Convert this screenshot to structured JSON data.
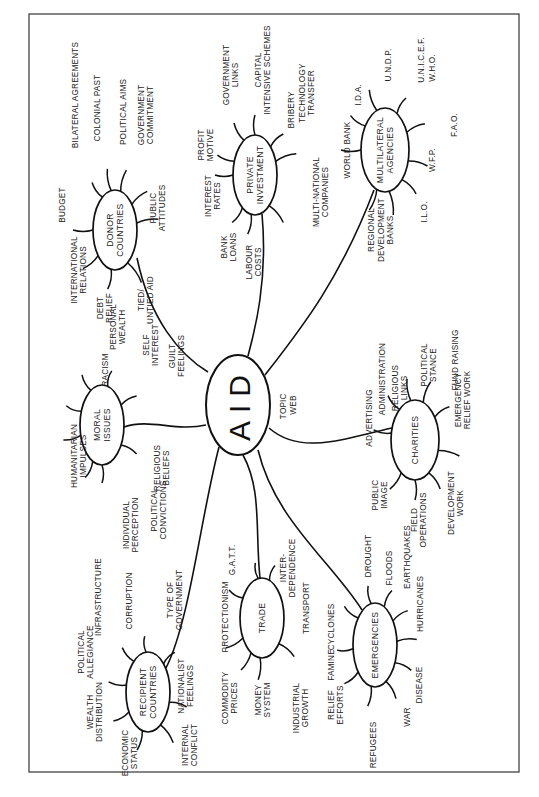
{
  "diagram": {
    "type": "topic-web",
    "orientation": "rotated-90-ccw",
    "hub": {
      "label": "AID",
      "note": [
        "TOPIC",
        "WEB"
      ]
    },
    "nodes": [
      {
        "id": "donor",
        "label": [
          "DONOR",
          "COUNTRIES"
        ],
        "branches": [
          [
            "BUDGET"
          ],
          [
            "BILATERAL AGREEMENTS"
          ],
          [
            "COLONIAL PAST"
          ],
          [
            "POLITICAL AIMS"
          ],
          [
            "GOVERNMENT",
            "COMMITMENT"
          ],
          [
            "PUBLIC",
            "ATTITUDES"
          ],
          [
            "TIED/",
            "UNTIED AID"
          ],
          [
            "DEBT",
            "RELIEF"
          ],
          [
            "INTERNATIONAL",
            "RELATIONS"
          ]
        ]
      },
      {
        "id": "private",
        "label": [
          "PRIVATE",
          "INVESTMENT"
        ],
        "branches": [
          [
            "PROFIT",
            "MOTIVE"
          ],
          [
            "GOVERNMENT",
            "LINKS"
          ],
          [
            "CAPITAL",
            "INTENSIVE SCHEMES"
          ],
          [
            "BRIBERY"
          ],
          [
            "TECHNOLOGY",
            "TRANSFER"
          ],
          [
            "MULTI-NATIONAL",
            "COMPANIES"
          ],
          [
            "LABOUR",
            "COSTS"
          ],
          [
            "BANK",
            "LOANS"
          ],
          [
            "INTEREST",
            "RATES"
          ]
        ]
      },
      {
        "id": "multilateral",
        "label": [
          "MULTILATERAL",
          "AGENCIES"
        ],
        "branches": [
          [
            "WORLD BANK"
          ],
          [
            "I.D.A."
          ],
          [
            "U.N.D.P."
          ],
          [
            "W.H.O."
          ],
          [
            "U.N.I.C.E.F."
          ],
          [
            "F.A.O."
          ],
          [
            "W.F.P."
          ],
          [
            "I.L.O."
          ],
          [
            "REGIONAL",
            "DEVELOPMENT",
            "BANKS"
          ]
        ]
      },
      {
        "id": "moral",
        "label": [
          "MORAL",
          "ISSUES"
        ],
        "branches": [
          [
            "RACISM"
          ],
          [
            "PERSONAL",
            "WEALTH"
          ],
          [
            "SELF",
            "INTEREST"
          ],
          [
            "GUILT",
            "FEELINGS"
          ],
          [
            "RELIGIOUS",
            "BELIEFS"
          ],
          [
            "POLITICAL",
            "CONVICTIONS"
          ],
          [
            "INDIVIDUAL",
            "PERCEPTION"
          ],
          [
            "HUMANITARIAN",
            "IMPULSES"
          ]
        ]
      },
      {
        "id": "charities",
        "label": [
          "CHARITIES"
        ],
        "branches": [
          [
            "ADVERTISING"
          ],
          [
            "ADMINISTRATION"
          ],
          [
            "RELIGIOUS",
            "LINKS"
          ],
          [
            "POLITICAL",
            "STANCE"
          ],
          [
            "FUND RAISING"
          ],
          [
            "EMERGENCY",
            "RELIEF WORK"
          ],
          [
            "DEVELOPMENT",
            "WORK"
          ],
          [
            "FIELD",
            "OPERATIONS"
          ],
          [
            "PUBLIC",
            "IMAGE"
          ]
        ]
      },
      {
        "id": "recipient",
        "label": [
          "RECIPIENT",
          "COUNTRIES"
        ],
        "branches": [
          [
            "POLITICAL",
            "ALLEGIANCE"
          ],
          [
            "INFRASTRUCTURE"
          ],
          [
            "CORRUPTION"
          ],
          [
            "TYPE OF",
            "GOVERNMENT"
          ],
          [
            "NATIONALIST",
            "FEELINGS"
          ],
          [
            "INTERNAL",
            "CONFLICT"
          ],
          [
            "ECONOMIC",
            "STATUS"
          ],
          [
            "WEALTH",
            "DISTRIBUTION"
          ]
        ]
      },
      {
        "id": "trade",
        "label": [
          "TRADE"
        ],
        "branches": [
          [
            "PROTECTIONISM"
          ],
          [
            "G.A.T.T."
          ],
          [
            "INTER-",
            "DEPENDENCE"
          ],
          [
            "TRANSPORT"
          ],
          [
            "INDUSTRIAL",
            "GROWTH"
          ],
          [
            "MONEY",
            "SYSTEM"
          ],
          [
            "COMMODITY",
            "PRICES"
          ]
        ]
      },
      {
        "id": "emergencies",
        "label": [
          "EMERGENCIES"
        ],
        "branches": [
          [
            "CYCLONES"
          ],
          [
            "DROUGHT"
          ],
          [
            "FLOODS"
          ],
          [
            "EARTHQUAKES"
          ],
          [
            "HURRICANES"
          ],
          [
            "DISEASE"
          ],
          [
            "WAR"
          ],
          [
            "REFUGEES"
          ],
          [
            "RELIEF",
            "EFFORTS"
          ],
          [
            "FAMINE"
          ]
        ]
      }
    ]
  }
}
